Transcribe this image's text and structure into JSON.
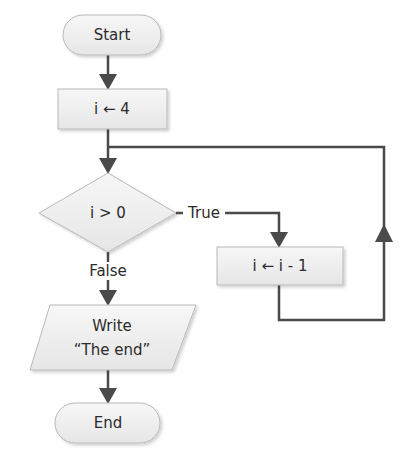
{
  "diagram": {
    "type": "flowchart",
    "nodes": {
      "start": {
        "shape": "terminal",
        "label": "Start"
      },
      "init": {
        "shape": "process",
        "label": "i ← 4"
      },
      "cond": {
        "shape": "decision",
        "label": "i > 0"
      },
      "dec": {
        "shape": "process",
        "label": "i ← i - 1"
      },
      "write_line1": {
        "shape": "io",
        "label": "Write"
      },
      "write_line2": {
        "shape": "io",
        "label": "“The end”"
      },
      "end": {
        "shape": "terminal",
        "label": "End"
      }
    },
    "edges": {
      "true_label": "True",
      "false_label": "False"
    },
    "colors": {
      "fill": "#f1f1f1",
      "stroke": "#b8b8b8",
      "line": "#4a4a4a",
      "text": "#2b2b2b"
    }
  }
}
